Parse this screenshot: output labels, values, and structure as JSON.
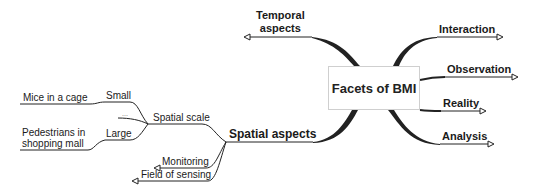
{
  "mindmap": {
    "central_topic": "Facets of BMI",
    "right_branches": [
      {
        "label": "Interaction"
      },
      {
        "label": "Observation"
      },
      {
        "label": "Reality"
      },
      {
        "label": "Analysis"
      }
    ],
    "left_branches": {
      "temporal": {
        "label_line1": "Temporal",
        "label_line2": "aspects"
      },
      "spatial": {
        "label": "Spatial aspects",
        "children": {
          "spatial_scale": {
            "label": "Spatial scale",
            "children": {
              "small": {
                "label": "Small",
                "example": "Mice in a cage"
              },
              "ellipsis": {
                "label": "..."
              },
              "large": {
                "label": "Large",
                "example_line1": "Pedestrians in",
                "example_line2": "shopping mall"
              }
            }
          },
          "monitoring": {
            "label": "Monitoring"
          },
          "field_of_sensing": {
            "label": "Field of sensing"
          }
        }
      }
    }
  },
  "colors": {
    "line": "#222222",
    "box_border": "#cfcfcf",
    "text": "#1a1a1a"
  }
}
